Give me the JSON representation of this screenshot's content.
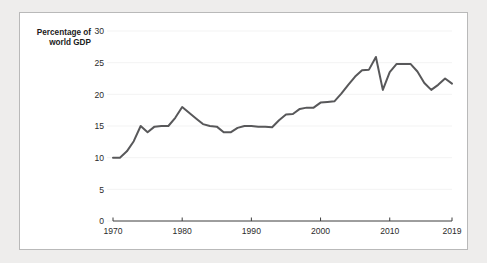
{
  "chart_data": {
    "type": "line",
    "title": "",
    "ylabel": "Percentage of world GDP",
    "ylabel_line1": "Percentage of",
    "ylabel_line2": "world GDP",
    "xlabel": "",
    "ylim": [
      0,
      30
    ],
    "xlim": [
      1970,
      2019
    ],
    "yticks": [
      0,
      5,
      10,
      15,
      20,
      25,
      30
    ],
    "ytick_labels": [
      "0",
      "5",
      "10",
      "15",
      "20",
      "25",
      "30"
    ],
    "xticks": [
      1970,
      1980,
      1990,
      2000,
      2010,
      2019
    ],
    "xtick_labels": [
      "1970",
      "1980",
      "1990",
      "2000",
      "2010",
      "2019"
    ],
    "grid": "horizontal",
    "legend": "none",
    "line_color": "#58585a",
    "x": [
      1970,
      1971,
      1972,
      1973,
      1974,
      1975,
      1976,
      1977,
      1978,
      1979,
      1980,
      1981,
      1982,
      1983,
      1984,
      1985,
      1986,
      1987,
      1988,
      1989,
      1990,
      1991,
      1992,
      1993,
      1994,
      1995,
      1996,
      1997,
      1998,
      1999,
      2000,
      2001,
      2002,
      2003,
      2004,
      2005,
      2006,
      2007,
      2008,
      2009,
      2010,
      2011,
      2012,
      2013,
      2014,
      2015,
      2016,
      2017,
      2018,
      2019
    ],
    "values": [
      10.0,
      10.0,
      11.0,
      12.6,
      15.0,
      14.0,
      14.9,
      15.0,
      15.0,
      16.3,
      18.0,
      17.1,
      16.2,
      15.3,
      15.0,
      14.9,
      14.0,
      14.0,
      14.7,
      15.0,
      15.0,
      14.9,
      14.9,
      14.8,
      15.9,
      16.8,
      16.9,
      17.7,
      17.9,
      17.9,
      18.7,
      18.8,
      18.9,
      20.1,
      21.5,
      22.8,
      23.8,
      23.9,
      25.9,
      20.7,
      23.5,
      24.8,
      24.8,
      24.8,
      23.6,
      21.8,
      20.7,
      21.5,
      22.5,
      21.7
    ]
  },
  "colors": {
    "page_background": "#eeedec",
    "panel_background": "#ffffff",
    "panel_border": "#b9b9b9",
    "line": "#58585a",
    "gridline": "#f2f2f2",
    "axis": "#3d3d3d",
    "text": "#2b2b2b"
  }
}
